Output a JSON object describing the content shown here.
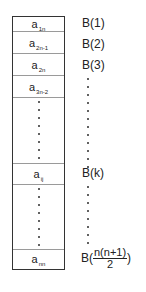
{
  "diagram": {
    "title": "",
    "cells": [
      {
        "base": "a",
        "sub": "1n"
      },
      {
        "base": "a",
        "sub": "2n-1"
      },
      {
        "base": "a",
        "sub": "2n"
      },
      {
        "base": "a",
        "sub": "3n-2"
      },
      {
        "base": "a",
        "sub": "ij"
      },
      {
        "base": "a",
        "sub": "nn"
      }
    ],
    "labels": [
      {
        "text": "B(1)"
      },
      {
        "text": "B(2)"
      },
      {
        "text": "B(3)"
      },
      {
        "text": "B(k)"
      },
      {
        "prefix": "B(",
        "numerator": "n(n+1)",
        "denominator": "2",
        "suffix": ")"
      }
    ],
    "ellipsis": "⋮"
  }
}
